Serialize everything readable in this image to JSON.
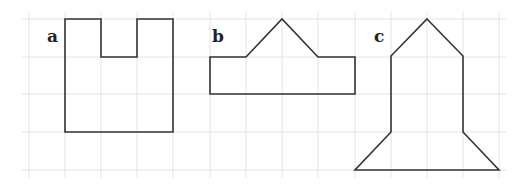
{
  "diagram": {
    "grid": {
      "x_lines": [
        29,
        65,
        101,
        137,
        173,
        210,
        246,
        282,
        318,
        355,
        391,
        427,
        463,
        499
      ],
      "y_lines": [
        19,
        57,
        94,
        132,
        170
      ],
      "x_extent": [
        22,
        506
      ],
      "y_extent": [
        12,
        178
      ],
      "color": "#e4e4e4"
    },
    "stroke_color": "#333333",
    "shapes": [
      {
        "label": "a",
        "label_pos": [
          47,
          28
        ],
        "points": "65,19 101,19 101,57 137,57 137,19 173,19 173,132 65,132"
      },
      {
        "label": "b",
        "label_pos": [
          212,
          28
        ],
        "points": "210,57 246,57 282,19 318,57 355,57 355,94 210,94"
      },
      {
        "label": "c",
        "label_pos": [
          374,
          28
        ],
        "points": "427,19 463,56 463,132 499,170 355,170 391,132 391,56"
      }
    ]
  }
}
